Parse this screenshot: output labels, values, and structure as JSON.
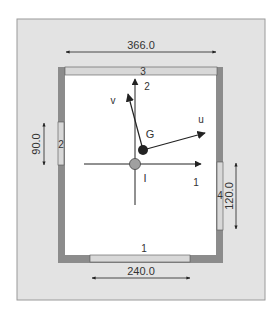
{
  "diagram": {
    "colors": {
      "background": "#ffffff",
      "panel": "#e3e3e3",
      "panel_border": "#9a9a9a",
      "wall": "#8c8c8c",
      "window": "#d8d8d8",
      "room_floor": "#ffffff",
      "point_I": "#a0a0a0",
      "point_G": "#222222",
      "ink": "#222222"
    },
    "dimensions": {
      "top_width": "366.0",
      "left_window": "90.0",
      "right_window": "120.0",
      "bottom_window": "240.0"
    },
    "windows": {
      "bottom": "1",
      "left": "2",
      "top": "3",
      "right": "4"
    },
    "axes": {
      "fixed_x": "1",
      "fixed_y": "2",
      "body_u": "u",
      "body_v": "v"
    },
    "points": {
      "origin": "I",
      "centroid": "G"
    }
  }
}
